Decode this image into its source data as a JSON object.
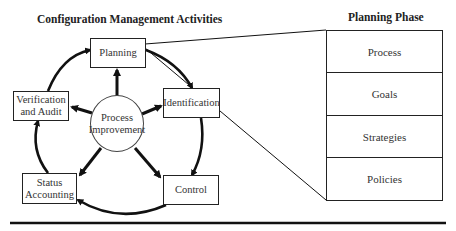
{
  "diagram": {
    "left_title": "Configuration Management Activities",
    "right_title": "Planning Phase",
    "center_node": {
      "line1": "Process",
      "line2": "Improvement"
    },
    "activities": [
      {
        "id": "planning",
        "line1": "Planning",
        "line2": ""
      },
      {
        "id": "identification",
        "line1": "Identification",
        "line2": ""
      },
      {
        "id": "control",
        "line1": "Control",
        "line2": ""
      },
      {
        "id": "status-accounting",
        "line1": "Status",
        "line2": "Accounting"
      },
      {
        "id": "verification-audit",
        "line1": "Verification",
        "line2": "and Audit"
      }
    ],
    "cycle_order": [
      "Planning",
      "Identification",
      "Control",
      "Status Accounting",
      "Verification and Audit",
      "Planning"
    ],
    "planning_phase_items": [
      "Process",
      "Goals",
      "Strategies",
      "Policies"
    ],
    "colors": {
      "line": "#111111",
      "background": "#ffffff",
      "text": "#333333"
    }
  }
}
